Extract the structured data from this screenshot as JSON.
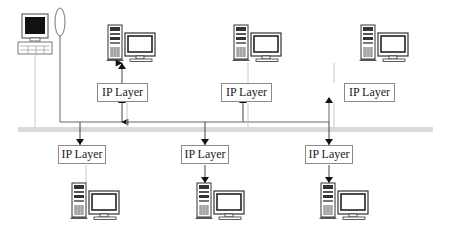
{
  "diagram": {
    "type": "network-ip-layer-diagram",
    "bus": {
      "name": "network-backbone",
      "color": "#d8d8d8"
    },
    "top_hosts": [
      {
        "id": "host-top-1",
        "ip_label": "IP Layer",
        "arrow_direction": "up"
      },
      {
        "id": "host-top-2",
        "ip_label": "IP Layer",
        "arrow_direction": "up"
      },
      {
        "id": "host-top-3",
        "ip_label": "IP Layer",
        "arrow_direction": "up"
      }
    ],
    "bottom_hosts": [
      {
        "id": "host-bottom-1",
        "ip_label": "IP Layer",
        "arrow_direction": "down"
      },
      {
        "id": "host-bottom-2",
        "ip_label": "IP Layer",
        "arrow_direction": "down"
      },
      {
        "id": "host-bottom-3",
        "ip_label": "IP Layer",
        "arrow_direction": "down"
      }
    ],
    "sender": {
      "id": "workstation",
      "device": "terminal with keyboard",
      "emitter": "oval-signal"
    },
    "colors": {
      "line": "#666666",
      "light_line": "#c8c8c8",
      "box_border": "#8a8a8a"
    }
  }
}
